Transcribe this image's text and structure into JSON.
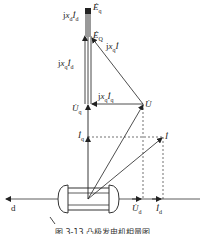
{
  "figure": {
    "type": "phasor diagram",
    "axes": {
      "d_axis_label": "d",
      "q_axis": "vertical"
    },
    "labels": {
      "Eq": "Ė",
      "Eq_sub": "q",
      "EQ": "Ė",
      "EQ_sub": "Q",
      "jxdId_j": "j",
      "jxdId_x": "x",
      "jxdId_xsub": "d",
      "jxdId_I": "İ",
      "jxdId_Isub": "d",
      "jxqId_top_j": "j",
      "jxqId_top_x": "x",
      "jxqId_top_xsub": "q",
      "jxqId_top_I": "İ",
      "jxqId_top_Isub": "d",
      "jxqI_j": "j",
      "jxqI_x": "x",
      "jxqI_xsub": "q",
      "jxqI_I": "İ",
      "jxqIq_j": "j",
      "jxqIq_x": "x",
      "jxqIq_xsub": "q",
      "jxqIq_I": "İ",
      "jxqIq_Isub": "q",
      "U": "U̇",
      "Uq": "U̇",
      "Uq_sub": "q",
      "Iq": "İ",
      "Iq_sub": "q",
      "I": "İ",
      "Ud": "U̇",
      "Ud_sub": "d",
      "Id": "İ",
      "Id_sub": "d"
    },
    "caption": "图 3-13 凸极发电机相量图"
  }
}
